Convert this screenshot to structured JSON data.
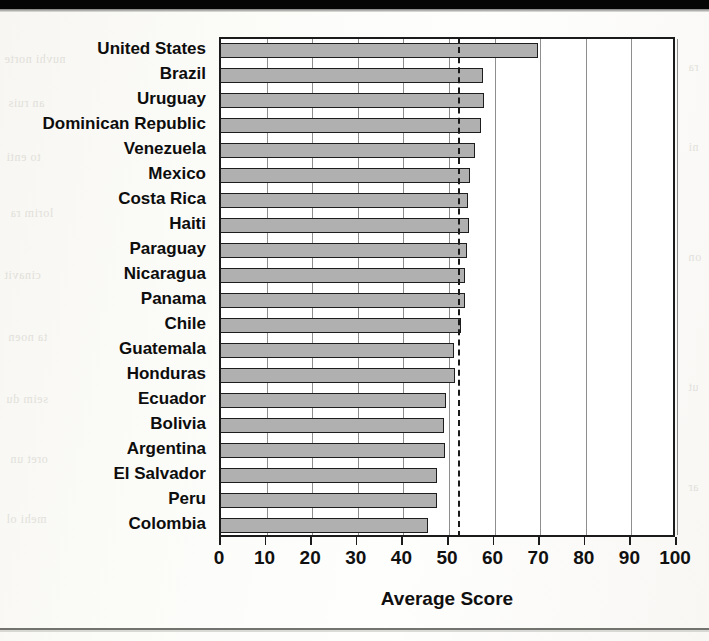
{
  "figure": {
    "x_axis_title": "Average Score",
    "y_axis_title": ""
  },
  "chart_data": {
    "type": "bar",
    "orientation": "horizontal",
    "title": "",
    "subtitle": "",
    "xlabel": "Average Score",
    "ylabel": "",
    "xlim": [
      0,
      100
    ],
    "xticks": [
      0,
      10,
      20,
      30,
      40,
      50,
      60,
      70,
      80,
      90,
      100
    ],
    "xticklabels": [
      "0",
      "10",
      "20",
      "30",
      "40",
      "50",
      "60",
      "70",
      "80",
      "90",
      "100"
    ],
    "grid": "vertical",
    "legend": "none",
    "bar_facecolor": "#b0b0b0",
    "bar_edgecolor": "#1d1d1d",
    "annotations": [
      {
        "type": "reference-line",
        "style": "dashed",
        "orientation": "vertical",
        "value": 52,
        "label": ""
      }
    ],
    "categories": [
      "United States",
      "Brazil",
      "Uruguay",
      "Dominican Republic",
      "Venezuela",
      "Mexico",
      "Costa Rica",
      "Haiti",
      "Paraguay",
      "Nicaragua",
      "Panama",
      "Chile",
      "Guatemala",
      "Honduras",
      "Ecuador",
      "Bolivia",
      "Argentina",
      "El Salvador",
      "Peru",
      "Colombia"
    ],
    "values": [
      69.5,
      57.5,
      57.7,
      57.1,
      55.8,
      54.6,
      54.1,
      54.3,
      53.9,
      53.6,
      53.4,
      52.6,
      51.2,
      51.3,
      49.3,
      48.9,
      49.1,
      47.4,
      47.3,
      45.5
    ]
  },
  "scan": {
    "ghost_left": "тхя м анстно",
    "ghost_right": "мантня мо"
  }
}
